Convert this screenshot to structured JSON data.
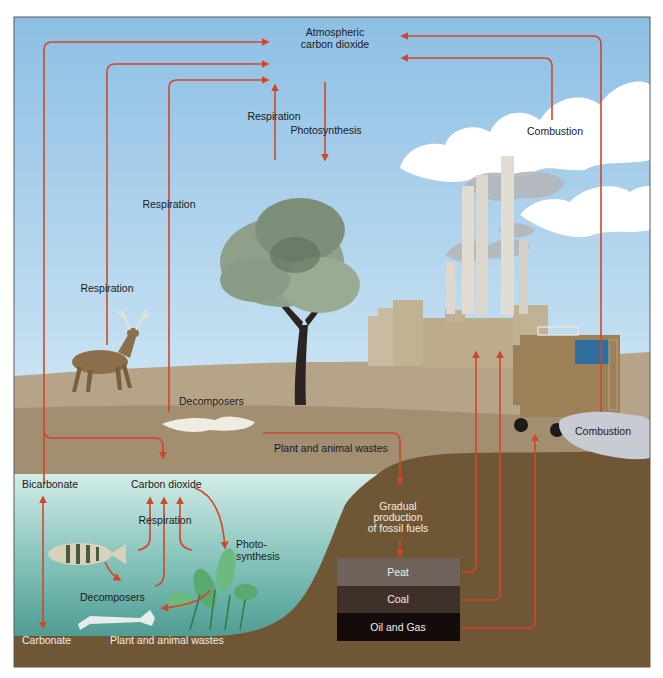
{
  "diagram": {
    "colors": {
      "arrow": "#d2462a",
      "sky_top": "#8fc1e6",
      "sky_bottom": "#eef6fb",
      "ground_light": "#b3a186",
      "ground_mid": "#a08b6d",
      "soil_dark": "#6e5634",
      "water_top": "#cfeae6",
      "water_bottom": "#5aa39a",
      "peat": "#6e625a",
      "coal": "#3f3129",
      "oil_gas": "#130c0a"
    },
    "atmosphere": {
      "label_line1": "Atmospheric",
      "label_line2": "carbon dioxide"
    },
    "land_labels": {
      "tree_respiration": "Respiration",
      "tree_photosynthesis": "Photosynthesis",
      "left_respiration": "Respiration",
      "deer_respiration": "Respiration",
      "decomposers": "Decomposers",
      "plant_animal_wastes": "Plant and animal wastes",
      "factory_combustion": "Combustion",
      "vehicle_combustion": "Combustion"
    },
    "fossil": {
      "label_line1": "Gradual",
      "label_line2": "production",
      "label_line3": "of fossil fuels",
      "layers": [
        {
          "name": "Peat"
        },
        {
          "name": "Coal"
        },
        {
          "name": "Oil and Gas"
        }
      ]
    },
    "water_labels": {
      "bicarbonate": "Bicarbonate",
      "carbon_dioxide": "Carbon dioxide",
      "respiration": "Respiration",
      "photo_line1": "Photo-",
      "photo_line2": "synthesis",
      "decomposers": "Decomposers",
      "carbonate": "Carbonate",
      "plant_animal_wastes": "Plant and animal wastes"
    }
  }
}
